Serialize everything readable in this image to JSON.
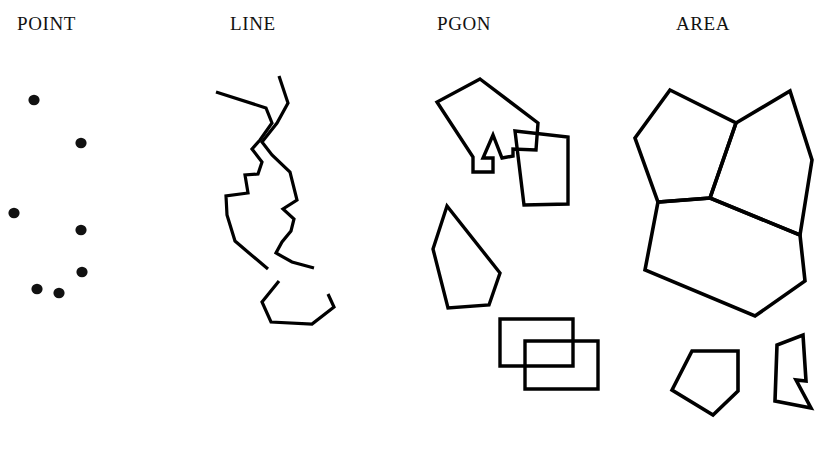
{
  "figure": {
    "background_color": "#ffffff",
    "ink_color": "#000000",
    "width": 824,
    "height": 451,
    "panels": [
      {
        "id": "point",
        "title": "POINT",
        "title_x": 17,
        "title_y": 13,
        "geometry_type": "points",
        "description": "Seven isolated filled dots scattered in the column",
        "dots": [
          {
            "cx": 34,
            "cy": 100,
            "rx": 5.6,
            "ry": 5.2
          },
          {
            "cx": 81,
            "cy": 143,
            "rx": 5.6,
            "ry": 5.2
          },
          {
            "cx": 14,
            "cy": 213,
            "rx": 5.6,
            "ry": 5.2
          },
          {
            "cx": 81,
            "cy": 230,
            "rx": 5.6,
            "ry": 5.2
          },
          {
            "cx": 82,
            "cy": 272,
            "rx": 5.6,
            "ry": 5.2
          },
          {
            "cx": 37,
            "cy": 289,
            "rx": 5.6,
            "ry": 5.2
          },
          {
            "cx": 59,
            "cy": 293,
            "rx": 5.6,
            "ry": 5.2
          }
        ]
      },
      {
        "id": "line",
        "title": "LINE",
        "title_x": 230,
        "title_y": 13,
        "geometry_type": "polylines",
        "description": "Two open polylines: a long zig-zag pair crossing near the top and a shallow U-shaped chain below",
        "polylines": [
          {
            "name": "left-zigzag-polyline",
            "stroke_width": 3.2,
            "points": "216,92 266,108 272,123 260,140 252,149 262,162 258,174 245,175 248,193 226,196 227,215 235,241 249,253 268,269"
          },
          {
            "name": "right-zigzag-polyline",
            "stroke_width": 3.2,
            "points": "279,76 288,103 277,123 262,142 272,155 290,172 297,200 283,209 294,219 291,231 282,242 276,253 292,262 314,268"
          },
          {
            "name": "u-shaped-polyline",
            "stroke_width": 3.2,
            "points": "279,281 262,302 271,322 312,324 334,307 328,294"
          }
        ]
      },
      {
        "id": "pgon",
        "title": "PGON",
        "title_x": 437,
        "title_y": 13,
        "geometry_type": "polygons",
        "description": "Four independent closed polygons, two pairs of which overlap each other",
        "polygons": [
          {
            "name": "arrow-polygon",
            "stroke_width": 3.4,
            "points": "480,79 538,123 536,150 513,149 513,156 502,158 493,135 483,158 493,158 493,172 473,172 473,157 437,102"
          },
          {
            "name": "tilted-quad-polygon",
            "stroke_width": 3.4,
            "points": "515,131 568,137 568,204 524,205"
          },
          {
            "name": "pentagon-polygon",
            "stroke_width": 3.4,
            "points": "447,206 500,273 489,305 448,308 433,249"
          },
          {
            "name": "upper-rectangle-polygon",
            "stroke_width": 3.4,
            "points": "500,319 573,319 573,366 500,366"
          },
          {
            "name": "lower-rectangle-polygon",
            "stroke_width": 3.4,
            "points": "525,341 598,341 598,389 525,389"
          }
        ]
      },
      {
        "id": "area",
        "title": "AREA",
        "title_x": 676,
        "title_y": 13,
        "geometry_type": "adjacent-polygons",
        "description": "A tessellation of three edge-sharing polygons forming one block, plus two detached small polygons below",
        "polygons": [
          {
            "name": "area-upper-left-polygon",
            "stroke_width": 3.6,
            "points": "670,90 736,123 710,198 658,202 635,138"
          },
          {
            "name": "area-upper-right-polygon",
            "stroke_width": 3.6,
            "points": "736,123 790,91 812,160 800,235 710,198"
          },
          {
            "name": "area-lower-polygon",
            "stroke_width": 3.6,
            "points": "658,202 710,198 800,235 805,281 755,316 645,270"
          },
          {
            "name": "small-pentagon-polygon",
            "stroke_width": 3.6,
            "points": "692,351 738,351 738,391 713,415 672,390"
          },
          {
            "name": "notched-polygon",
            "stroke_width": 3.6,
            "points": "803,335 806,381 796,380 811,408 775,401 777,345"
          }
        ]
      }
    ]
  }
}
